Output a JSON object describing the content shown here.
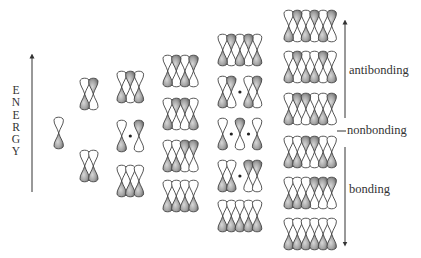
{
  "axis": {
    "label": "ENERGY",
    "letters": [
      "E",
      "N",
      "E",
      "R",
      "G",
      "Y"
    ]
  },
  "labels": {
    "antibonding": "antibonding",
    "nonbonding": "nonbonding",
    "bonding": "bonding"
  },
  "colors": {
    "lobe_fill": "#9a9a9a",
    "lobe_outline": "#444444",
    "line": "#333333"
  },
  "legend": {
    "G": "shaded (grey) lobe phase",
    "W": "unshaded (white) lobe phase",
    "N": "node (dot, no orbital)"
  },
  "columns": [
    {
      "n": 1,
      "x": 54,
      "rows": [
        {
          "y": 117,
          "top": [
            "W"
          ]
        }
      ]
    },
    {
      "n": 2,
      "x": 80,
      "rows": [
        {
          "y": 78,
          "top": [
            "W",
            "G"
          ]
        },
        {
          "y": 150,
          "top": [
            "W",
            "W"
          ]
        }
      ]
    },
    {
      "n": 3,
      "x": 117,
      "rows": [
        {
          "y": 71,
          "top": [
            "W",
            "G",
            "W"
          ]
        },
        {
          "y": 120,
          "top": [
            "W",
            "N",
            "G"
          ]
        },
        {
          "y": 165,
          "top": [
            "W",
            "W",
            "W"
          ]
        }
      ]
    },
    {
      "n": 4,
      "x": 163,
      "rows": [
        {
          "y": 55,
          "top": [
            "W",
            "G",
            "W",
            "G"
          ]
        },
        {
          "y": 98,
          "top": [
            "W",
            "G",
            "G",
            "W"
          ]
        },
        {
          "y": 140,
          "top": [
            "W",
            "W",
            "G",
            "G"
          ]
        },
        {
          "y": 180,
          "top": [
            "W",
            "W",
            "W",
            "W"
          ]
        }
      ]
    },
    {
      "n": 5,
      "x": 218,
      "rows": [
        {
          "y": 34,
          "top": [
            "W",
            "G",
            "W",
            "G",
            "W"
          ]
        },
        {
          "y": 76,
          "top": [
            "W",
            "G",
            "N",
            "W",
            "G"
          ]
        },
        {
          "y": 118,
          "top": [
            "W",
            "N",
            "G",
            "N",
            "W"
          ]
        },
        {
          "y": 160,
          "top": [
            "W",
            "W",
            "N",
            "G",
            "G"
          ]
        },
        {
          "y": 200,
          "top": [
            "W",
            "W",
            "W",
            "W",
            "W"
          ]
        }
      ]
    },
    {
      "n": 6,
      "x": 284,
      "rows": [
        {
          "y": 10,
          "top": [
            "W",
            "G",
            "W",
            "G",
            "W",
            "G"
          ]
        },
        {
          "y": 51,
          "top": [
            "W",
            "G",
            "W",
            "W",
            "G",
            "W"
          ]
        },
        {
          "y": 93,
          "top": [
            "W",
            "G",
            "G",
            "W",
            "W",
            "G"
          ]
        },
        {
          "y": 136,
          "top": [
            "W",
            "W",
            "G",
            "G",
            "W",
            "W"
          ]
        },
        {
          "y": 177,
          "top": [
            "W",
            "W",
            "W",
            "G",
            "G",
            "G"
          ]
        },
        {
          "y": 218,
          "top": [
            "W",
            "W",
            "W",
            "W",
            "W",
            "W"
          ]
        }
      ]
    }
  ]
}
